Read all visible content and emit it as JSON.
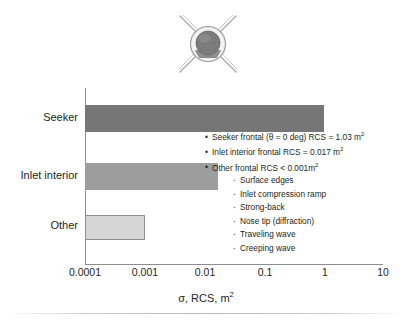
{
  "figure": {
    "icon": {
      "name": "missile-seeker-front-view-icon",
      "description": "Head-on view of missile seeker with dome, inlet and X fins"
    }
  },
  "chart_data": {
    "type": "bar",
    "orientation": "horizontal",
    "title": "",
    "xlabel": "σ, RCS, m²",
    "ylabel": "",
    "xscale": "log",
    "xlim": [
      0.0001,
      10
    ],
    "xticks": [
      "0.0001",
      "0.001",
      "0.01",
      "0.1",
      "1",
      "10"
    ],
    "grid": false,
    "legend": "none",
    "categories": [
      "Seeker",
      "Inlet interior",
      "Other"
    ],
    "values": [
      1.03,
      0.017,
      0.001
    ],
    "colors": [
      "#767676",
      "#9d9d9d",
      "#d6d6d6"
    ],
    "annotations": [
      {
        "level": 1,
        "bullet": "•",
        "text": "Seeker frontal (θ = 0 deg) RCS = 1.03 m",
        "sup": "2"
      },
      {
        "level": 1,
        "bullet": "•",
        "text": "Inlet interior frontal RCS = 0.017 m",
        "sup": "2"
      },
      {
        "level": 1,
        "bullet": "•",
        "text": "Other frontal RCS < 0.001m",
        "sup": "2"
      },
      {
        "level": 2,
        "bullet": "·",
        "text": "Surface edges",
        "sup": ""
      },
      {
        "level": 2,
        "bullet": "·",
        "text": "Inlet compression ramp",
        "sup": ""
      },
      {
        "level": 2,
        "bullet": "·",
        "text": "Strong-back",
        "sup": ""
      },
      {
        "level": 2,
        "bullet": "·",
        "text": "Nose tip (diffraction)",
        "sup": ""
      },
      {
        "level": 2,
        "bullet": "·",
        "text": "Traveling wave",
        "sup": ""
      },
      {
        "level": 2,
        "bullet": "·",
        "text": "Creeping wave",
        "sup": ""
      }
    ]
  },
  "axis": {
    "x_title_main": "σ, RCS, m",
    "x_title_sup": "2"
  }
}
